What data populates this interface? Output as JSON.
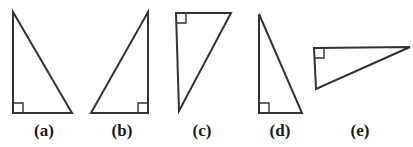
{
  "figure": {
    "name": "right-triangles-multiple-orientations",
    "background_color": "#ffffff",
    "stroke_color": "#333333",
    "stroke_width": 2,
    "right_angle_marker_color": "#333333",
    "right_angle_marker_width": 1.4,
    "label_color": "#1a1a1a",
    "canvas": {
      "width": 413,
      "height": 147
    }
  },
  "shapes": [
    {
      "id": "triangle-a",
      "label": "(a)",
      "label_center_x": 44,
      "points": "13,12 13,113 72,113",
      "right_angle_vertex": "bottom-left",
      "right_angle_marker_path": "M 13,103 L 23,103 L 23,113",
      "orientation": "vertical leg on left, horizontal leg on bottom, apex top-left",
      "legs": {
        "vertical_px": 101,
        "horizontal_px": 59
      }
    },
    {
      "id": "triangle-b",
      "label": "(b)",
      "label_center_x": 122,
      "points": "148,12 148,113 91,113",
      "right_angle_vertex": "bottom-right",
      "right_angle_marker_path": "M 148,103 L 138,103 L 138,113",
      "orientation": "vertical leg on right, horizontal leg on bottom, apex top-right",
      "legs": {
        "vertical_px": 101,
        "horizontal_px": 57
      }
    },
    {
      "id": "triangle-c",
      "label": "(c)",
      "label_center_x": 202,
      "points": "176,13 231,13 179,111",
      "right_angle_vertex": "top-left",
      "right_angle_marker_path": "M 176,23 L 186,23 L 186,13",
      "orientation": "horizontal leg on top, near-vertical leg on left, apex top-right",
      "legs": {
        "vertical_px": 98,
        "horizontal_px": 55
      }
    },
    {
      "id": "triangle-d",
      "label": "(d)",
      "label_center_x": 280,
      "points": "259,14 259,113 302,113",
      "right_angle_vertex": "bottom-left",
      "right_angle_marker_path": "M 259,103 L 269,103 L 269,113",
      "orientation": "vertical leg on left, horizontal leg on bottom, apex top-left",
      "legs": {
        "vertical_px": 99,
        "horizontal_px": 43
      }
    },
    {
      "id": "triangle-e",
      "label": "(e)",
      "label_center_x": 360,
      "points": "314,48 410,47 316,89",
      "right_angle_vertex": "top-left",
      "right_angle_marker_path": "M 314,58 L 324,58 L 324,48",
      "orientation": "long horizontal leg on top, short vertical leg on left, apex top-right",
      "legs": {
        "vertical_px": 41,
        "horizontal_px": 96
      }
    }
  ],
  "labels": {
    "a": "(a)",
    "b": "(b)",
    "c": "(c)",
    "d": "(d)",
    "e": "(e)"
  }
}
